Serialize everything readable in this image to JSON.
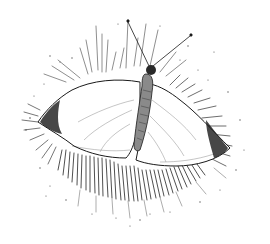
{
  "image": {
    "subject": "butterfly",
    "style": "pen-and-ink illustration",
    "alt": "Pen-and-ink drawing of a white butterfly with wings spread, surrounded by radiating hatch strokes",
    "colors": {
      "background": "#ffffff",
      "ink": "#1a1a1a",
      "wing": "#ffffff"
    }
  }
}
